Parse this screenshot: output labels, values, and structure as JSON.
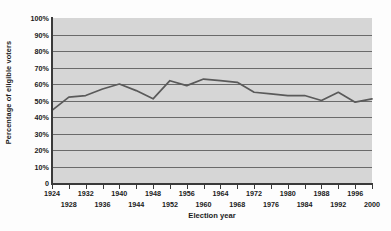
{
  "chart_data": {
    "type": "line",
    "title": "",
    "xlabel": "Election year",
    "ylabel": "Percentage of eligible voters",
    "xlim": [
      1924,
      2000
    ],
    "ylim": [
      0,
      100
    ],
    "grid": true,
    "legend": false,
    "y_tick_labels": [
      "100%",
      "90%",
      "80%",
      "70%",
      "60%",
      "50%",
      "40%",
      "30%",
      "20%",
      "10%",
      "0"
    ],
    "y_tick_values": [
      100,
      90,
      80,
      70,
      60,
      50,
      40,
      30,
      20,
      10,
      0
    ],
    "x_tick_labels_row1": [
      "1924",
      "1932",
      "1940",
      "1948",
      "1956",
      "1964",
      "1972",
      "1980",
      "1988",
      "1996"
    ],
    "x_tick_values_row1": [
      1924,
      1932,
      1940,
      1948,
      1956,
      1964,
      1972,
      1980,
      1988,
      1996
    ],
    "x_tick_labels_row2": [
      "1928",
      "1936",
      "1944",
      "1952",
      "1960",
      "1968",
      "1976",
      "1984",
      "1992",
      "2000"
    ],
    "x_tick_values_row2": [
      1928,
      1936,
      1944,
      1952,
      1960,
      1968,
      1976,
      1984,
      1992,
      2000
    ],
    "series": [
      {
        "name": "Voter turnout",
        "color": "#5a5a5a",
        "x": [
          1924,
          1928,
          1932,
          1936,
          1940,
          1944,
          1948,
          1952,
          1956,
          1960,
          1964,
          1968,
          1972,
          1976,
          1980,
          1984,
          1988,
          1992,
          1996,
          2000
        ],
        "values": [
          44,
          52,
          53,
          57,
          60,
          56,
          51,
          62,
          59,
          63,
          62,
          61,
          55,
          54,
          53,
          53,
          50,
          55,
          49,
          51
        ]
      }
    ],
    "colors": {
      "plot_background": "#d6d6d6",
      "gridline": "#6a6a6a",
      "axis": "#3a3a3a",
      "line": "#5a5a5a",
      "text": "#1a1a1a",
      "figure_background": "#fdfdfd"
    }
  }
}
